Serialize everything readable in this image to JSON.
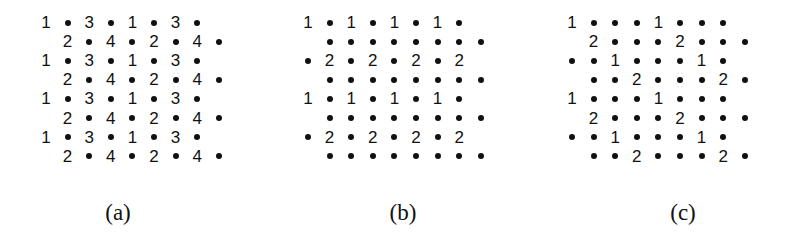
{
  "figure": {
    "layout": {
      "row_y_start": 24,
      "row_spacing": 19.1,
      "col_spacing": 21.6
    },
    "panels": [
      {
        "id": "a",
        "caption": "(a)",
        "caption_x": 118,
        "origin_x": 46,
        "rows": [
          {
            "start_col": 0,
            "cells": [
              "1",
              "•",
              "3",
              "•",
              "1",
              "•",
              "3",
              "•"
            ]
          },
          {
            "start_col": 1,
            "cells": [
              "2",
              "•",
              "4",
              "•",
              "2",
              "•",
              "4",
              "•"
            ]
          },
          {
            "start_col": 0,
            "cells": [
              "1",
              "•",
              "3",
              "•",
              "1",
              "•",
              "3",
              "•"
            ]
          },
          {
            "start_col": 1,
            "cells": [
              "2",
              "•",
              "4",
              "•",
              "2",
              "•",
              "4",
              "•"
            ]
          },
          {
            "start_col": 0,
            "cells": [
              "1",
              "•",
              "3",
              "•",
              "1",
              "•",
              "3",
              "•"
            ]
          },
          {
            "start_col": 1,
            "cells": [
              "2",
              "•",
              "4",
              "•",
              "2",
              "•",
              "4",
              "•"
            ]
          },
          {
            "start_col": 0,
            "cells": [
              "1",
              "•",
              "3",
              "•",
              "1",
              "•",
              "3",
              "•"
            ]
          },
          {
            "start_col": 1,
            "cells": [
              "2",
              "•",
              "4",
              "•",
              "2",
              "•",
              "4",
              "•"
            ]
          }
        ]
      },
      {
        "id": "b",
        "caption": "(b)",
        "caption_x": 403,
        "origin_x": 308,
        "rows": [
          {
            "start_col": 0,
            "cells": [
              "1",
              "•",
              "1",
              "•",
              "1",
              "•",
              "1",
              "•"
            ]
          },
          {
            "start_col": 1,
            "cells": [
              "•",
              "•",
              "•",
              "•",
              "•",
              "•",
              "•",
              "•"
            ]
          },
          {
            "start_col": 0,
            "cells": [
              "•",
              "2",
              "•",
              "2",
              "•",
              "2",
              "•",
              "2"
            ]
          },
          {
            "start_col": 1,
            "cells": [
              "•",
              "•",
              "•",
              "•",
              "•",
              "•",
              "•",
              "•"
            ]
          },
          {
            "start_col": 0,
            "cells": [
              "1",
              "•",
              "1",
              "•",
              "1",
              "•",
              "1",
              "•"
            ]
          },
          {
            "start_col": 1,
            "cells": [
              "•",
              "•",
              "•",
              "•",
              "•",
              "•",
              "•",
              "•"
            ]
          },
          {
            "start_col": 0,
            "cells": [
              "•",
              "2",
              "•",
              "2",
              "•",
              "2",
              "•",
              "2"
            ]
          },
          {
            "start_col": 1,
            "cells": [
              "•",
              "•",
              "•",
              "•",
              "•",
              "•",
              "•",
              "•"
            ]
          }
        ]
      },
      {
        "id": "c",
        "caption": "(c)",
        "caption_x": 683,
        "origin_x": 572,
        "rows": [
          {
            "start_col": 0,
            "cells": [
              "1",
              "•",
              "•",
              "•",
              "1",
              "•",
              "•",
              "•"
            ]
          },
          {
            "start_col": 1,
            "cells": [
              "2",
              "•",
              "•",
              "•",
              "2",
              "•",
              "•",
              "•"
            ]
          },
          {
            "start_col": 0,
            "cells": [
              "•",
              "•",
              "1",
              "•",
              "•",
              "•",
              "1",
              "•"
            ]
          },
          {
            "start_col": 1,
            "cells": [
              "•",
              "•",
              "2",
              "•",
              "•",
              "•",
              "2",
              "•"
            ]
          },
          {
            "start_col": 0,
            "cells": [
              "1",
              "•",
              "•",
              "•",
              "1",
              "•",
              "•",
              "•"
            ]
          },
          {
            "start_col": 1,
            "cells": [
              "2",
              "•",
              "•",
              "•",
              "2",
              "•",
              "•",
              "•"
            ]
          },
          {
            "start_col": 0,
            "cells": [
              "•",
              "•",
              "1",
              "•",
              "•",
              "•",
              "1",
              "•"
            ]
          },
          {
            "start_col": 1,
            "cells": [
              "•",
              "•",
              "2",
              "•",
              "•",
              "•",
              "2",
              "•"
            ]
          }
        ]
      }
    ]
  }
}
